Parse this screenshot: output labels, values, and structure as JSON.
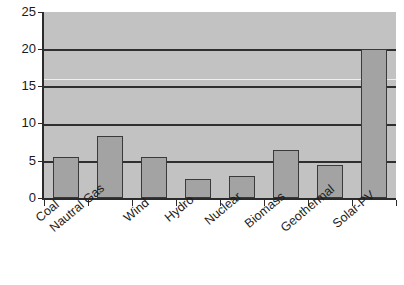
{
  "chart_data": {
    "type": "bar",
    "title": "",
    "subtitle": "",
    "xlabel": "",
    "ylabel": "",
    "categories": [
      "Coal",
      "Nautral Gas",
      "Wind",
      "Hydro",
      "Nuclear",
      "Biomass",
      "Geothermal",
      "Solar-PV"
    ],
    "values": [
      5.5,
      8.4,
      5.5,
      2.5,
      3.0,
      6.4,
      4.4,
      20.0
    ],
    "series": [
      {
        "name": "",
        "values": [
          5.5,
          8.4,
          5.5,
          2.5,
          3.0,
          6.4,
          4.4,
          20.0
        ]
      }
    ],
    "ylim": [
      0,
      25
    ],
    "xlim_categorical": true,
    "ytick_labels": [
      "0",
      "5",
      "10",
      "15",
      "20",
      "25"
    ],
    "ytick_values": [
      0,
      5,
      10,
      15,
      20,
      25
    ],
    "gridlines": {
      "horizontal": true,
      "vertical": false,
      "values": [
        5,
        10,
        15,
        20
      ]
    },
    "legend": {
      "visible": false,
      "position": "none",
      "entries": []
    },
    "annotations": [],
    "colors": {
      "bar_fill": "#a3a3a3",
      "bar_border": "#3a3a3a",
      "plot_background": "#c2c2c2",
      "figure_background": "#ffffff",
      "gridline": "#2f2f2f",
      "axis": "#2b2b2b",
      "text": "#1d1d1d"
    }
  }
}
